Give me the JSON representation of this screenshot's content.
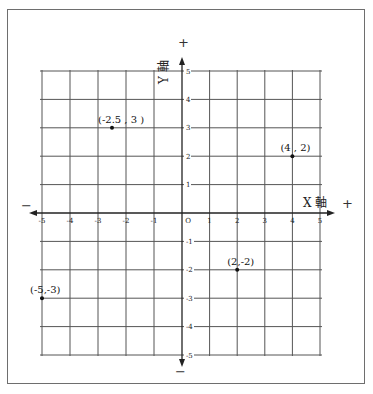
{
  "chart_data": {
    "type": "scatter",
    "title": "",
    "xlabel": "X 軸",
    "ylabel": "Y 軸",
    "xlim": [
      -5,
      5
    ],
    "ylim": [
      -5,
      5
    ],
    "grid": true,
    "x_ticks": [
      "-5",
      "-4",
      "-3",
      "-2",
      "-1",
      "O",
      "1",
      "2",
      "3",
      "4",
      "5"
    ],
    "y_ticks": [
      "5",
      "4",
      "3",
      "2",
      "1",
      "-1",
      "-2",
      "-3",
      "-4",
      "-5"
    ],
    "series": [
      {
        "name": "points",
        "points": [
          {
            "x": -2.5,
            "y": 3,
            "label": "(-2.5 , 3 )"
          },
          {
            "x": 4,
            "y": 2,
            "label": "(4 , 2)"
          },
          {
            "x": 2,
            "y": -2,
            "label": "(2,-2)"
          },
          {
            "x": -5,
            "y": -3,
            "label": "(-5,-3)"
          }
        ]
      }
    ],
    "annotations": {
      "x_positive": "+",
      "x_negative": "−",
      "y_positive": "+",
      "y_negative": "−"
    }
  }
}
